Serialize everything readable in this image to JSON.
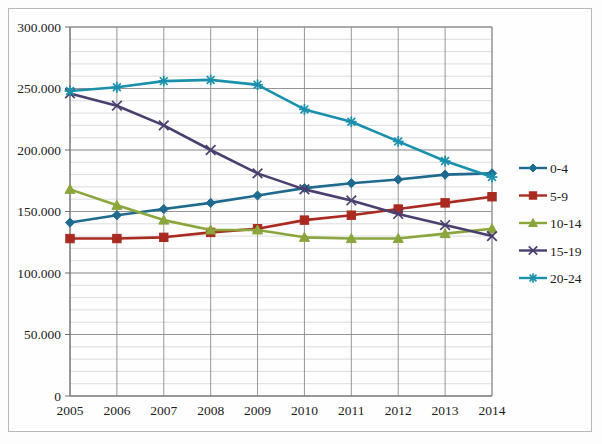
{
  "chart_data": {
    "type": "line",
    "title": "",
    "xlabel": "",
    "ylabel": "",
    "categories": [
      "2005",
      "2006",
      "2007",
      "2008",
      "2009",
      "2010",
      "2011",
      "2012",
      "2013",
      "2014"
    ],
    "x": [
      2005,
      2006,
      2007,
      2008,
      2009,
      2010,
      2011,
      2012,
      2013,
      2014
    ],
    "xlim": [
      2005,
      2014
    ],
    "ylim": [
      0,
      300000
    ],
    "y_ticks": [
      0,
      50000,
      100000,
      150000,
      200000,
      250000,
      300000
    ],
    "y_tick_labels": [
      "0",
      "50.000",
      "100.000",
      "150.000",
      "200.000",
      "250.000",
      "300.000"
    ],
    "minor_gridline_step": 10000,
    "grid": true,
    "legend_position": "right",
    "series": [
      {
        "name": "0-4",
        "color": "#1f6a8f",
        "marker": "diamond",
        "values": [
          141000,
          147000,
          152000,
          157000,
          163000,
          169000,
          173000,
          176000,
          180000,
          181000
        ]
      },
      {
        "name": "5-9",
        "color": "#a92a21",
        "marker": "square",
        "values": [
          128000,
          128000,
          129000,
          133000,
          136000,
          143000,
          147000,
          152000,
          157000,
          162000
        ]
      },
      {
        "name": "10-14",
        "color": "#8aa63c",
        "marker": "triangle",
        "values": [
          168000,
          155000,
          143000,
          135000,
          135000,
          129000,
          128000,
          128000,
          132000,
          136000
        ]
      },
      {
        "name": "15-19",
        "color": "#4a3f6e",
        "marker": "x",
        "values": [
          246000,
          236000,
          220000,
          200000,
          181000,
          168000,
          159000,
          148000,
          139000,
          130000
        ]
      },
      {
        "name": "20-24",
        "color": "#1a90ad",
        "marker": "asterisk",
        "values": [
          248000,
          251000,
          256000,
          257000,
          253000,
          233000,
          223000,
          207000,
          191000,
          178000
        ]
      }
    ]
  },
  "legend": {
    "entries": [
      {
        "label": "0-4"
      },
      {
        "label": "5-9"
      },
      {
        "label": "10-14"
      },
      {
        "label": "15-19"
      },
      {
        "label": "20-24"
      }
    ]
  }
}
